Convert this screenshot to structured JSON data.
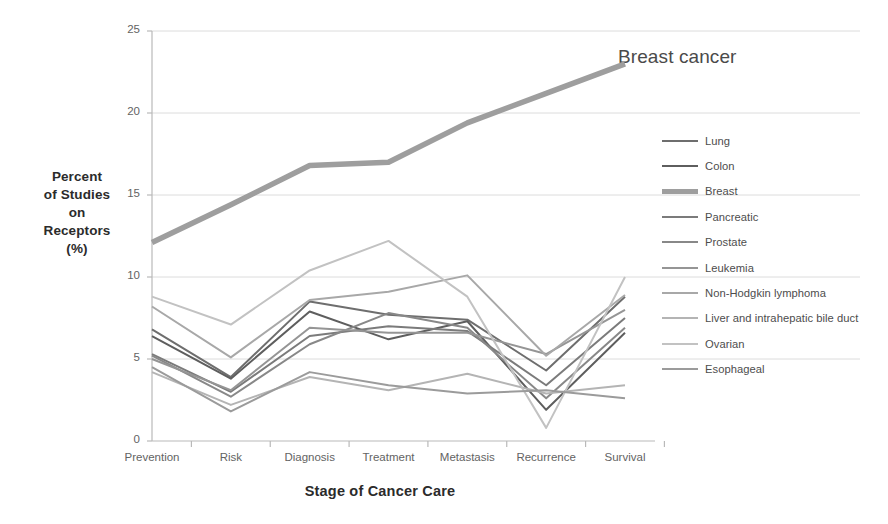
{
  "chart_data": {
    "type": "line",
    "title": "",
    "xlabel": "Stage of Cancer Care",
    "ylabel": "Percent of Studies on Receptors (%)",
    "ylabel_lines": [
      "Percent",
      "of Studies",
      "on",
      "Receptors",
      "(%)"
    ],
    "categories": [
      "Prevention",
      "Risk",
      "Diagnosis",
      "Treatment",
      "Metastasis",
      "Recurrence",
      "Survival"
    ],
    "ylim": [
      0,
      25
    ],
    "yticks": [
      0,
      5,
      10,
      15,
      20,
      25
    ],
    "grid": "horizontal",
    "legend_position": "right",
    "annotations": [
      {
        "text": "Breast cancer",
        "series": "Breast",
        "x": "Survival"
      }
    ],
    "series": [
      {
        "name": "Lung",
        "color": "#6e6e6e",
        "width": 2.0,
        "values": [
          6.8,
          3.9,
          8.5,
          7.7,
          7.4,
          4.3,
          8.8
        ]
      },
      {
        "name": "Colon",
        "color": "#5e5e5e",
        "width": 2.0,
        "values": [
          6.4,
          3.8,
          7.9,
          6.2,
          7.3,
          1.9,
          6.6
        ]
      },
      {
        "name": "Breast",
        "color": "#9e9e9e",
        "width": 5.5,
        "values": [
          12.1,
          14.4,
          16.8,
          17.0,
          19.4,
          21.2,
          23.0
        ]
      },
      {
        "name": "Pancreatic",
        "color": "#7b7b7b",
        "width": 2.0,
        "values": [
          5.3,
          3.0,
          6.4,
          7.0,
          6.7,
          3.4,
          7.5
        ]
      },
      {
        "name": "Prostate",
        "color": "#888888",
        "width": 2.0,
        "values": [
          5.2,
          2.7,
          5.9,
          7.8,
          6.9,
          2.6,
          6.9
        ]
      },
      {
        "name": "Leukemia",
        "color": "#959595",
        "width": 2.0,
        "values": [
          5.0,
          3.1,
          6.9,
          6.6,
          6.6,
          5.3,
          8.0
        ]
      },
      {
        "name": "Non-Hodgkin lymphoma",
        "color": "#a8a8a8",
        "width": 2.0,
        "values": [
          8.2,
          5.1,
          8.6,
          9.1,
          10.1,
          5.2,
          8.9
        ]
      },
      {
        "name": "Liver and intrahepatic bile duct",
        "color": "#b4b4b4",
        "width": 2.0,
        "values": [
          4.2,
          2.2,
          3.9,
          3.1,
          4.1,
          2.9,
          3.4
        ]
      },
      {
        "name": "Ovarian",
        "color": "#c2c2c2",
        "width": 2.0,
        "values": [
          8.8,
          7.1,
          10.4,
          12.2,
          8.8,
          0.8,
          10.0
        ]
      },
      {
        "name": "Esophageal",
        "color": "#9b9b9b",
        "width": 2.0,
        "values": [
          4.5,
          1.8,
          4.2,
          3.4,
          2.9,
          3.1,
          2.6
        ]
      }
    ]
  },
  "axis": {
    "ytick_labels": [
      "25",
      "20",
      "15",
      "10",
      "5",
      "0"
    ],
    "xtick_labels": [
      "Prevention",
      "Risk",
      "Diagnosis",
      "Treatment",
      "Metastasis",
      "Recurrence",
      "Survival"
    ]
  },
  "annotation": {
    "breast_cancer": "Breast cancer"
  },
  "colors": {
    "axis_line": "#b9b9b9",
    "grid_line": "#dcdcdc",
    "tick_text": "#636363",
    "title_text": "#2b2b2b"
  }
}
